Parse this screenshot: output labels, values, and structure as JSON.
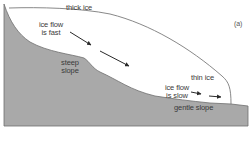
{
  "diagram": {
    "panel_label": "(a)",
    "labels": {
      "thick_ice": "thick ice",
      "fast_flow_line1": "ice flow",
      "fast_flow_line2": "is fast",
      "steep_slope_line1": "steep",
      "steep_slope_line2": "slope",
      "thin_ice": "thin ice",
      "slow_flow_line1": "ice flow",
      "slow_flow_line2": "is slow",
      "gentle_slope": "gentle slope"
    },
    "colors": {
      "bedrock": "#a9a9a9",
      "bedrock_outline": "#6e6e6e",
      "ice": "#ffffff",
      "ice_outline": "#7a7a7a",
      "arrow": "#2a2a2a",
      "text": "#3a3a3a"
    },
    "arrows": [
      {
        "name": "fast-flow-arrow-1",
        "from": [
          70,
          32
        ],
        "to": [
          91,
          45
        ]
      },
      {
        "name": "fast-flow-arrow-2",
        "from": [
          100,
          51
        ],
        "to": [
          129,
          66
        ]
      },
      {
        "name": "slow-flow-arrow-1",
        "from": [
          191,
          92
        ],
        "to": [
          201,
          94
        ]
      },
      {
        "name": "slow-flow-arrow-2",
        "from": [
          209,
          96
        ],
        "to": [
          221,
          97
        ]
      }
    ]
  }
}
